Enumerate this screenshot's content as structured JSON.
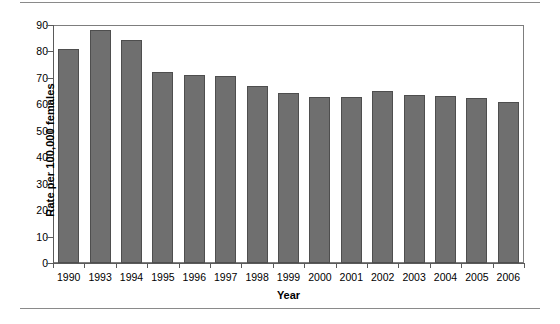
{
  "chart_data": {
    "type": "bar",
    "title": "",
    "subtitle": "",
    "xlabel": "Year",
    "ylabel": "Rate per 100,000 females",
    "categories": [
      "1990",
      "1993",
      "1994",
      "1995",
      "1996",
      "1997",
      "1998",
      "1999",
      "2000",
      "2001",
      "2002",
      "2003",
      "2004",
      "2005",
      "2006"
    ],
    "values": [
      80.8,
      88.0,
      84.2,
      72.4,
      71.0,
      70.7,
      67.0,
      64.2,
      62.7,
      62.7,
      65.0,
      63.5,
      63.2,
      62.4,
      60.7
    ],
    "series": [
      {
        "name": "Rate per 100,000 females",
        "values": [
          80.8,
          88.0,
          84.2,
          72.4,
          71.0,
          70.7,
          67.0,
          64.2,
          62.7,
          62.7,
          65.0,
          63.5,
          63.2,
          62.4,
          60.7
        ]
      }
    ],
    "ylim": [
      0,
      90
    ],
    "yticks": [
      0,
      10,
      20,
      30,
      40,
      50,
      60,
      70,
      80,
      90
    ],
    "ytick_labels": [
      "0",
      "10",
      "20",
      "30",
      "40",
      "50",
      "60",
      "70",
      "80",
      "90"
    ],
    "grid": false,
    "legend": null,
    "legend_position": "none",
    "bar_color": "#6f6f6f",
    "bar_edge_color": "#4e4e4e",
    "axis_color": "#5a5a5a",
    "frame_color": "#7d7d7d",
    "background_color": "#ffffff",
    "rule_color": "#8a8a8a",
    "annotations": []
  }
}
